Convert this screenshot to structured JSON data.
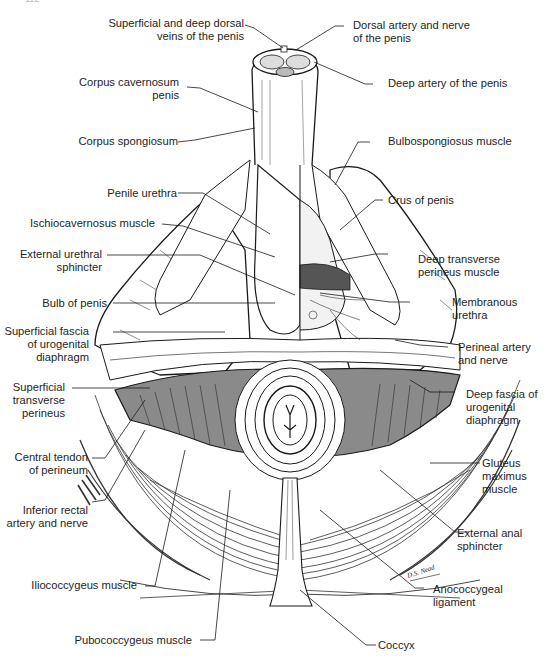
{
  "figure": {
    "page_number": "112",
    "signature": "D.S. Nead",
    "colors": {
      "ink": "#1a1a1a",
      "shading": "#8a8a8a",
      "background": "#ffffff"
    }
  },
  "labels": {
    "left": [
      {
        "id": "dorsal-veins",
        "lines": [
          "Superficial and deep dorsal",
          "veins of the penis"
        ]
      },
      {
        "id": "corpus-cavernosum",
        "lines": [
          "Corpus cavernosum",
          "penis"
        ]
      },
      {
        "id": "corpus-spongiosum",
        "lines": [
          "Corpus spongiosum"
        ]
      },
      {
        "id": "penile-urethra",
        "lines": [
          "Penile urethra"
        ]
      },
      {
        "id": "ischiocavernosus",
        "lines": [
          "Ischiocavernosus muscle"
        ]
      },
      {
        "id": "external-urethral-sphincter",
        "lines": [
          "External urethral",
          "sphincter"
        ]
      },
      {
        "id": "bulb-of-penis",
        "lines": [
          "Bulb of penis"
        ]
      },
      {
        "id": "superficial-fascia",
        "lines": [
          "Superficial fascia",
          "of urogenital",
          "diaphragm"
        ]
      },
      {
        "id": "superficial-transverse-perineus",
        "lines": [
          "Superficial",
          "transverse",
          "perineus"
        ]
      },
      {
        "id": "central-tendon",
        "lines": [
          "Central tendon",
          "of perineum"
        ]
      },
      {
        "id": "inferior-rectal",
        "lines": [
          "Inferior rectal",
          "artery and nerve"
        ]
      },
      {
        "id": "iliococcygeus",
        "lines": [
          "Iliococcygeus muscle"
        ]
      },
      {
        "id": "pubococcygeus",
        "lines": [
          "Pubococcygeus muscle"
        ]
      }
    ],
    "right": [
      {
        "id": "dorsal-artery-nerve",
        "lines": [
          "Dorsal artery and nerve",
          "of the penis"
        ]
      },
      {
        "id": "deep-artery",
        "lines": [
          "Deep artery of the penis"
        ]
      },
      {
        "id": "bulbospongiosus",
        "lines": [
          "Bulbospongiosus muscle"
        ]
      },
      {
        "id": "crus-of-penis",
        "lines": [
          "Crus of penis"
        ]
      },
      {
        "id": "deep-transverse-perineus",
        "lines": [
          "Deep transverse",
          "perineus muscle"
        ]
      },
      {
        "id": "membranous-urethra",
        "lines": [
          "Membranous",
          "urethra"
        ]
      },
      {
        "id": "perineal-artery-nerve",
        "lines": [
          "Perineal artery",
          "and nerve"
        ]
      },
      {
        "id": "deep-fascia",
        "lines": [
          "Deep fascia of",
          "urogenital",
          "diaphragm"
        ]
      },
      {
        "id": "gluteus-maximus",
        "lines": [
          "Gluteus",
          "maximus",
          "muscle"
        ]
      },
      {
        "id": "external-anal-sphincter",
        "lines": [
          "External anal",
          "sphincter"
        ]
      },
      {
        "id": "anococcygeal-ligament",
        "lines": [
          "Anococcygeal",
          "ligament"
        ]
      },
      {
        "id": "coccyx",
        "lines": [
          "Coccyx"
        ]
      }
    ]
  }
}
